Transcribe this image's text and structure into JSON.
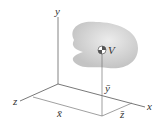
{
  "diagram": {
    "axes": {
      "x": "x",
      "y": "y",
      "z": "z"
    },
    "body_label": "V",
    "coordinates": {
      "x_bar": "x̄",
      "y_bar": "ȳ",
      "z_bar": "z̄"
    },
    "colors": {
      "body": "#d6d6d6",
      "axis": "#555555"
    }
  }
}
